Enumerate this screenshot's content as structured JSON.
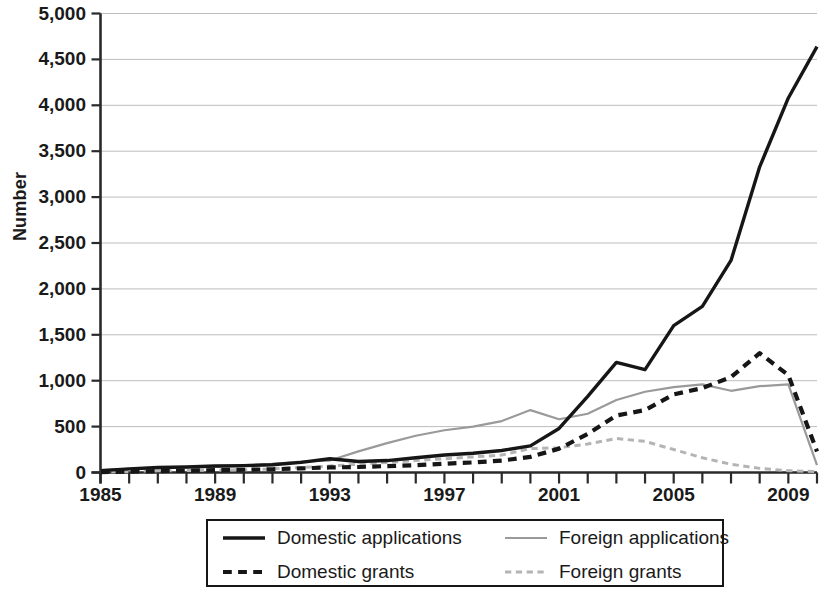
{
  "chart_data": {
    "type": "line",
    "title": "",
    "xlabel": "",
    "ylabel": "Number",
    "xlim": [
      1985,
      2010
    ],
    "ylim": [
      0,
      5000
    ],
    "ytick_step": 500,
    "ytick_labels": [
      "5,000",
      "4,500",
      "4,000",
      "3,500",
      "3,000",
      "2,500",
      "2,000",
      "1,500",
      "1,000",
      "500",
      "0"
    ],
    "ytick_values": [
      5000,
      4500,
      4000,
      3500,
      3000,
      2500,
      2000,
      1500,
      1000,
      500,
      0
    ],
    "xtick_labels": [
      "1985",
      "1989",
      "1993",
      "1997",
      "2001",
      "2005",
      "2009"
    ],
    "xtick_values": [
      1985,
      1989,
      1993,
      1997,
      2001,
      2005,
      2009
    ],
    "x_minor_step": 1,
    "grid": "horizontal",
    "legend_position": "below-center",
    "x": [
      1985,
      1986,
      1987,
      1988,
      1989,
      1990,
      1991,
      1992,
      1993,
      1994,
      1995,
      1996,
      1997,
      1998,
      1999,
      2000,
      2001,
      2002,
      2003,
      2004,
      2005,
      2006,
      2007,
      2008,
      2009,
      2010
    ],
    "series": [
      {
        "name": "Domestic applications",
        "style": "solid",
        "color": "#161616",
        "width": 3.4,
        "values": [
          20,
          40,
          55,
          60,
          70,
          75,
          85,
          110,
          150,
          120,
          130,
          160,
          190,
          210,
          240,
          290,
          480,
          830,
          1200,
          1120,
          1600,
          1810,
          2310,
          3330,
          4080,
          4640
        ]
      },
      {
        "name": "Foreign applications",
        "style": "solid",
        "color": "#9a9a9a",
        "width": 2.2,
        "values": [
          25,
          40,
          50,
          55,
          60,
          70,
          95,
          120,
          130,
          230,
          320,
          400,
          460,
          500,
          560,
          680,
          580,
          640,
          790,
          880,
          930,
          960,
          890,
          940,
          960,
          80
        ]
      },
      {
        "name": "Domestic grants",
        "style": "dashed",
        "color": "#161616",
        "width": 4.2,
        "values": [
          5,
          10,
          15,
          20,
          25,
          30,
          35,
          45,
          55,
          60,
          70,
          80,
          95,
          110,
          130,
          170,
          260,
          420,
          620,
          680,
          850,
          920,
          1040,
          1300,
          1060,
          230
        ]
      },
      {
        "name": "Foreign grants",
        "style": "dashed",
        "color": "#b4b4b4",
        "width": 3.0,
        "values": [
          8,
          12,
          18,
          22,
          26,
          30,
          40,
          55,
          70,
          90,
          110,
          130,
          150,
          170,
          190,
          260,
          270,
          310,
          370,
          340,
          250,
          160,
          90,
          45,
          20,
          10
        ]
      }
    ]
  },
  "legend": {
    "items": [
      {
        "label": "Domestic applications",
        "style": "solid",
        "color": "#161616",
        "width": 3.4
      },
      {
        "label": "Foreign applications",
        "style": "solid",
        "color": "#9a9a9a",
        "width": 2.2
      },
      {
        "label": "Domestic grants",
        "style": "dashed",
        "color": "#161616",
        "width": 4.2
      },
      {
        "label": "Foreign grants",
        "style": "dashed",
        "color": "#b4b4b4",
        "width": 3.0
      }
    ]
  },
  "axes": {
    "axis_color": "#2a2a2a",
    "grid_color": "#bdbdbd"
  }
}
